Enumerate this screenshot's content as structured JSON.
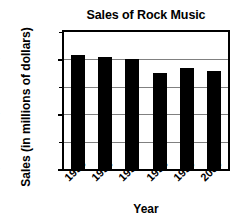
{
  "chart_data": {
    "type": "bar",
    "title": "Sales of Rock Music",
    "xlabel": "Year",
    "ylabel": "Sales (in millions of dollars)",
    "categories": [
      "1995",
      "1996",
      "1997",
      "1998",
      "1999",
      "2000"
    ],
    "values": [
      4150,
      4100,
      4000,
      3500,
      3680,
      3560
    ],
    "ylim": [
      0,
      5000
    ],
    "yticks": [
      0,
      1000,
      2000,
      3000,
      4000,
      5000
    ],
    "ytick_labels": [
      "0",
      "",
      "2000",
      "",
      "4000",
      ""
    ],
    "grid": true,
    "grid_axis": "y",
    "legend": false,
    "bar_color": "#000000",
    "grid_color": "#808080",
    "frame_color": "#000000",
    "background_color": "#ffffff"
  }
}
